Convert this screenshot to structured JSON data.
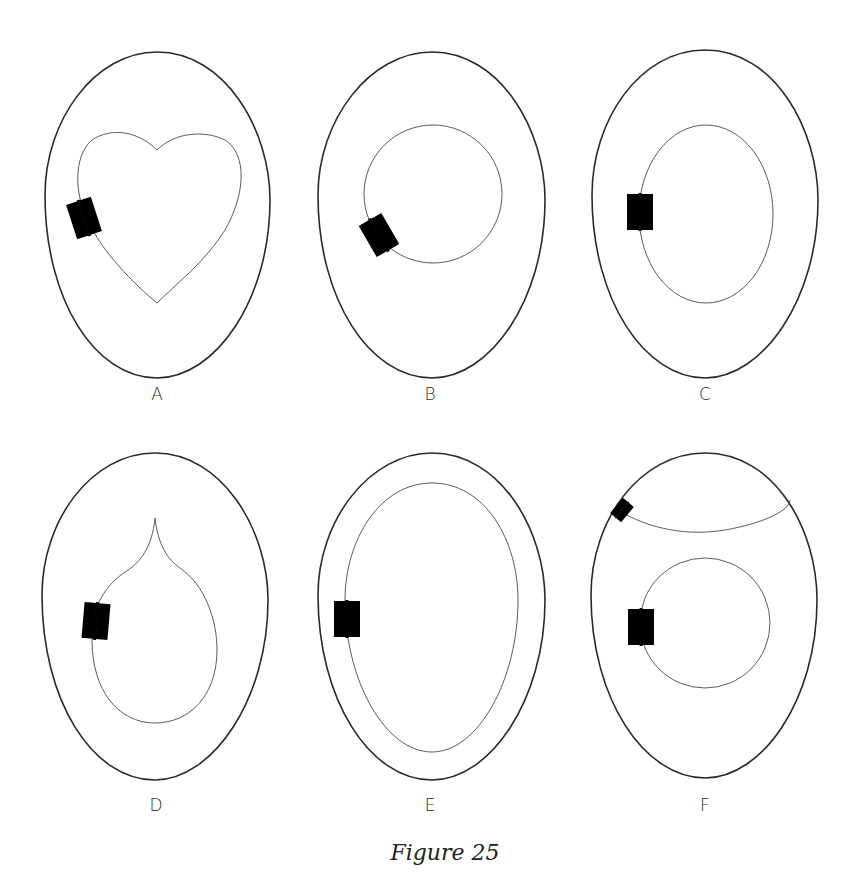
{
  "figure": {
    "caption": "Figure 25",
    "panels": [
      {
        "label": "A",
        "inner_shape": "heart",
        "hinge_position": "left side of heart"
      },
      {
        "label": "B",
        "inner_shape": "circle",
        "hinge_position": "lower-left of circle"
      },
      {
        "label": "C",
        "inner_shape": "oval",
        "hinge_position": "left side of oval"
      },
      {
        "label": "D",
        "inner_shape": "teardrop",
        "hinge_position": "left side of teardrop"
      },
      {
        "label": "E",
        "inner_shape": "egg-shaped inner door",
        "hinge_position": "left side"
      },
      {
        "label": "F",
        "inner_shape": "top cap and circle",
        "hinge_position": "top-left of cap and left side of circle"
      }
    ]
  },
  "colors": {
    "line": "#2a2a2a",
    "background": "#ffffff"
  }
}
